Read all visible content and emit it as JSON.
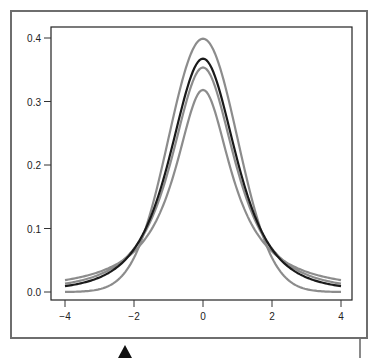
{
  "chart_data": {
    "type": "line",
    "title": "",
    "xlabel": "",
    "ylabel": "",
    "xlim": [
      -4,
      4
    ],
    "ylim": [
      0,
      0.4
    ],
    "grid": false,
    "legend": null,
    "x_ticks": [
      "−4",
      "−2",
      "0",
      "2",
      "4"
    ],
    "y_ticks": [
      "0.0",
      "0.1",
      "0.2",
      "0.3",
      "0.4"
    ],
    "x": [
      -4,
      -3,
      -2,
      -1,
      0,
      1,
      2,
      3,
      4
    ],
    "series": [
      {
        "name": "normal",
        "color": "#8c8c8c",
        "peak": 0.399,
        "values": [
          0.0001,
          0.0044,
          0.054,
          0.242,
          0.399,
          0.242,
          0.054,
          0.0044,
          0.0001
        ]
      },
      {
        "name": "t df=3",
        "color": "#1a1a1a",
        "peak": 0.368,
        "values": [
          0.0092,
          0.023,
          0.0675,
          0.207,
          0.368,
          0.207,
          0.0675,
          0.023,
          0.0092
        ]
      },
      {
        "name": "t df=2",
        "color": "#8c8c8c",
        "peak": 0.354,
        "values": [
          0.0131,
          0.0274,
          0.068,
          0.192,
          0.354,
          0.192,
          0.068,
          0.0274,
          0.0131
        ]
      },
      {
        "name": "t df=1 (Cauchy)",
        "color": "#8c8c8c",
        "peak": 0.318,
        "values": [
          0.0187,
          0.0318,
          0.0637,
          0.159,
          0.318,
          0.159,
          0.0637,
          0.0318,
          0.0187
        ]
      }
    ]
  },
  "axis": {
    "x_ticks": [
      "−4",
      "−2",
      "0",
      "2",
      "4"
    ],
    "y_ticks": [
      "0.0",
      "0.1",
      "0.2",
      "0.3",
      "0.4"
    ]
  }
}
